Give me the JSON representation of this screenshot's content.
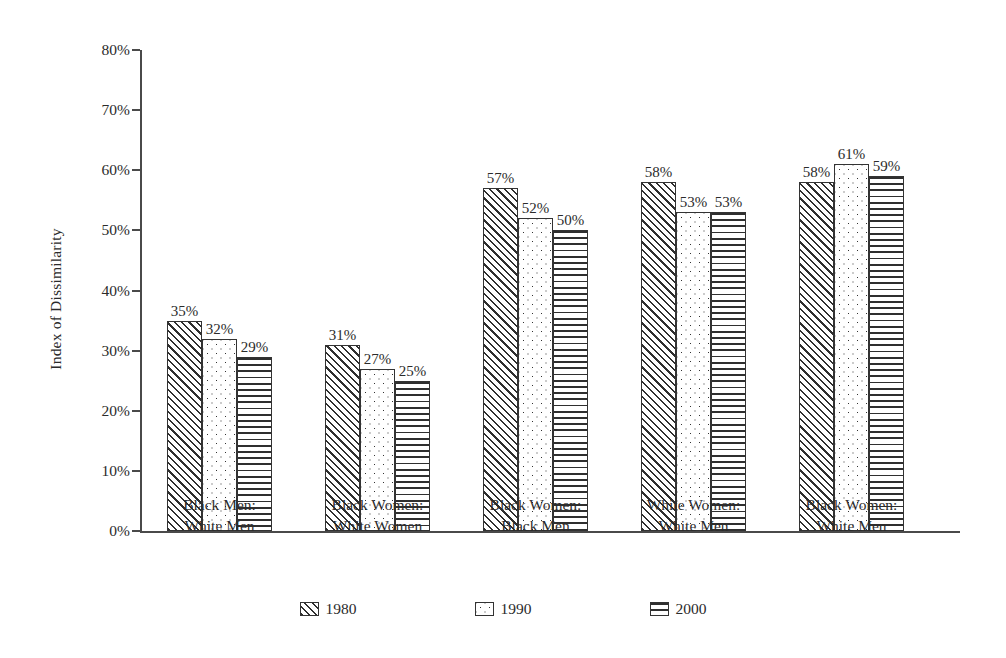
{
  "chart_data": {
    "type": "bar",
    "title": "",
    "subtitle": "",
    "xlabel": "",
    "ylabel": "Index of Dissimilarity",
    "ylim": [
      0,
      80
    ],
    "y_unit": "%",
    "grid": false,
    "legend_position": "bottom",
    "y_ticks": [
      "0%",
      "10%",
      "20%",
      "30%",
      "40%",
      "50%",
      "60%",
      "70%",
      "80%"
    ],
    "y_tick_values": [
      0,
      10,
      20,
      30,
      40,
      50,
      60,
      70,
      80
    ],
    "categories": [
      {
        "line1": "Black Men:",
        "line2": "White Men"
      },
      {
        "line1": "Black Women:",
        "line2": "White Women"
      },
      {
        "line1": "Black Women:",
        "line2": "Black Men"
      },
      {
        "line1": "White Women:",
        "line2": "White Men"
      },
      {
        "line1": "Black Women:",
        "line2": "White Men"
      }
    ],
    "series": [
      {
        "name": "1980",
        "pattern": "diagonal-hatch",
        "values": [
          35,
          31,
          57,
          58,
          58
        ],
        "labels": [
          "35%",
          "31%",
          "57%",
          "58%",
          "58%"
        ]
      },
      {
        "name": "1990",
        "pattern": "dots",
        "values": [
          32,
          27,
          52,
          53,
          61
        ],
        "labels": [
          "32%",
          "27%",
          "52%",
          "53%",
          "61%"
        ]
      },
      {
        "name": "2000",
        "pattern": "horizontal-lines",
        "values": [
          29,
          25,
          50,
          53,
          59
        ],
        "labels": [
          "29%",
          "25%",
          "50%",
          "53%",
          "59%"
        ]
      }
    ],
    "colors": {
      "background": "#ffffff",
      "axis": "#4a4a4a",
      "bar_outline": "#333333",
      "bar_fill": "#ffffff",
      "text": "#2b2b2b"
    }
  },
  "legend": {
    "items": [
      {
        "label": "1980",
        "pattern": "diagonal-hatch"
      },
      {
        "label": "1990",
        "pattern": "dots"
      },
      {
        "label": "2000",
        "pattern": "horizontal-lines"
      }
    ]
  }
}
